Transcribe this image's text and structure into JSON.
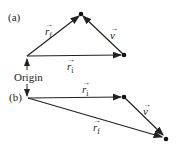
{
  "panels": {
    "a": {
      "label": "(a)",
      "vectors": {
        "rf": {
          "symbol": "r",
          "sub": "f",
          "arrow": "→"
        },
        "ri": {
          "symbol": "r",
          "sub": "i",
          "arrow": "→"
        },
        "v": {
          "symbol": "v",
          "arrow": "→"
        }
      }
    },
    "b": {
      "label": "(b)",
      "vectors": {
        "ri": {
          "symbol": "r",
          "sub": "i",
          "arrow": "→"
        },
        "v": {
          "symbol": "v",
          "arrow": "→"
        },
        "rf": {
          "symbol": "r",
          "sub": "f",
          "arrow": "→"
        }
      }
    }
  },
  "origin_label": "Origin",
  "colors": {
    "line": "#222222"
  }
}
